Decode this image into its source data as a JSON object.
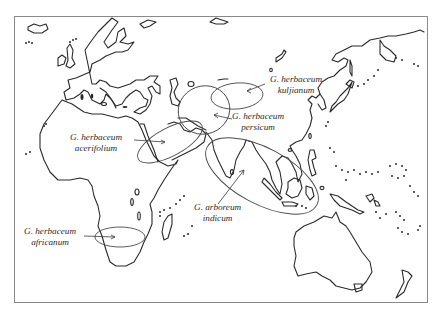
{
  "map": {
    "region": "Old World (Africa, Europe, Asia, Oceania)",
    "labels": [
      {
        "id": "kuljianum",
        "line1": "G. herbaceum",
        "line2": "kuljianum"
      },
      {
        "id": "persicum",
        "line1": "G. herbaceum",
        "line2": "persicum"
      },
      {
        "id": "acerifolium",
        "line1": "G. herbaceum",
        "line2": "acerifolium"
      },
      {
        "id": "indicum",
        "line1": "G. arboreum",
        "line2": "indicum"
      },
      {
        "id": "africanum",
        "line1": "G. herbaceum",
        "line2": "africanum"
      }
    ],
    "colors": {
      "line": "#2a2a2a",
      "frame": "#8a8a8a",
      "background": "#ffffff"
    }
  }
}
